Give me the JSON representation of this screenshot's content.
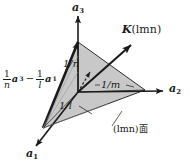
{
  "figure": {
    "background_color": "#ffffff",
    "line_color": "#1a1a1a",
    "plane_fill_color": "#c8c8c8"
  },
  "axes": [
    {
      "id": "a1",
      "label": "a",
      "subscript": "1",
      "direction": "lower-left"
    },
    {
      "id": "a2",
      "label": "a",
      "subscript": "2",
      "direction": "right"
    },
    {
      "id": "a3",
      "label": "a",
      "subscript": "3",
      "direction": "up"
    }
  ],
  "vectors": {
    "k": {
      "symbol": "K",
      "args": "(lmn)",
      "description": "reciprocal lattice vector normal to the plane"
    },
    "edge": {
      "term1_num": "1",
      "term1_den": "n",
      "term1_vec": "a",
      "term1_sub": "3",
      "operator": "−",
      "term2_num": "1",
      "term2_den": "l",
      "term2_vec": "a",
      "term2_sub": "1"
    }
  },
  "intercepts": [
    {
      "id": "n",
      "text": "1/n",
      "axis": "a3"
    },
    {
      "id": "m",
      "text": "1/m",
      "axis": "a2"
    },
    {
      "id": "l",
      "text": "1/l",
      "axis": "a1"
    }
  ],
  "plane_caption": {
    "indices": "(lmn)",
    "word": "面"
  }
}
